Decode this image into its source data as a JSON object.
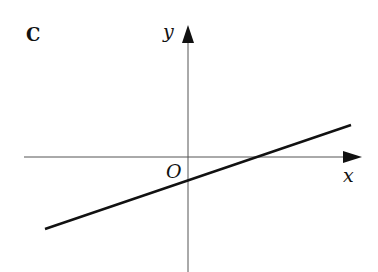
{
  "figure": {
    "panel_label": "C",
    "y_axis_label": "y",
    "x_axis_label": "x",
    "origin_label": "O"
  },
  "graph": {
    "description": "Straight line with positive gradient, negative y-intercept and positive x-intercept",
    "line_color": "#111111",
    "axis_color": "#555555"
  }
}
